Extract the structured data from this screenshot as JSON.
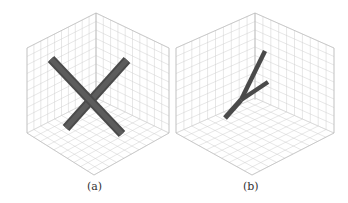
{
  "figure": {
    "panels": [
      {
        "id": "a",
        "caption": "(a)",
        "description": "3D axes box with two crossing cylindrical rods forming an X",
        "z_ticks": [
          "0",
          "0.1",
          "0.2",
          "0.3",
          "0.4",
          "0.5",
          "0.6",
          "0.7",
          "0.8",
          "0.9",
          "1"
        ],
        "x_ticks": [
          "0",
          "0.1",
          "0.2",
          "0.3",
          "0.4",
          "0.5",
          "0.6",
          "0.7",
          "0.8",
          "0.9",
          "1"
        ],
        "y_ticks": [
          "0",
          "0.1",
          "0.2",
          "0.3",
          "0.4",
          "0.5",
          "0.6",
          "0.7",
          "0.8",
          "0.9",
          "1"
        ],
        "rod_color": "#555555"
      },
      {
        "id": "b",
        "caption": "(b)",
        "description": "3D axes box with a Y-shaped branching rod",
        "z_ticks": [
          "0",
          "0.1",
          "0.2",
          "0.3",
          "0.4",
          "0.5",
          "0.6",
          "0.7",
          "0.8",
          "0.9",
          "1"
        ],
        "x_ticks": [
          "0",
          "0.1",
          "0.2",
          "0.3",
          "0.4",
          "0.5",
          "0.6",
          "0.7",
          "0.8",
          "0.9",
          "1"
        ],
        "y_ticks": [
          "0",
          "0.1",
          "0.2",
          "0.3",
          "0.4",
          "0.5",
          "0.6",
          "0.7",
          "0.8",
          "0.9",
          "1"
        ],
        "rod_color": "#555555"
      }
    ]
  }
}
